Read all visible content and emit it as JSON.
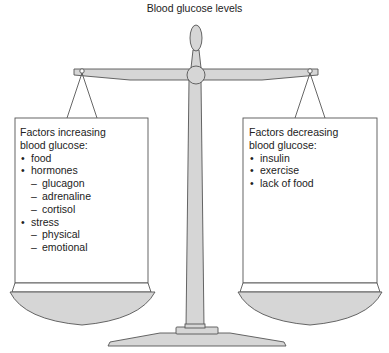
{
  "title": "Blood glucose levels",
  "colors": {
    "fill": "#d6d6d6",
    "stroke": "#555555",
    "box_fill": "#ffffff",
    "text": "#222222"
  },
  "left_pan": {
    "heading_line1": "Factors increasing",
    "heading_line2": "blood glucose:",
    "items": [
      {
        "type": "bullet",
        "label": "food"
      },
      {
        "type": "bullet",
        "label": "hormones"
      },
      {
        "type": "sub",
        "label": "glucagon"
      },
      {
        "type": "sub",
        "label": "adrenaline"
      },
      {
        "type": "sub",
        "label": "cortisol"
      },
      {
        "type": "bullet",
        "label": "stress"
      },
      {
        "type": "sub",
        "label": "physical"
      },
      {
        "type": "sub",
        "label": "emotional"
      }
    ]
  },
  "right_pan": {
    "heading_line1": "Factors decreasing",
    "heading_line2": "blood glucose:",
    "items": [
      {
        "type": "bullet",
        "label": "insulin"
      },
      {
        "type": "bullet",
        "label": "exercise"
      },
      {
        "type": "bullet",
        "label": "lack of food"
      }
    ]
  }
}
